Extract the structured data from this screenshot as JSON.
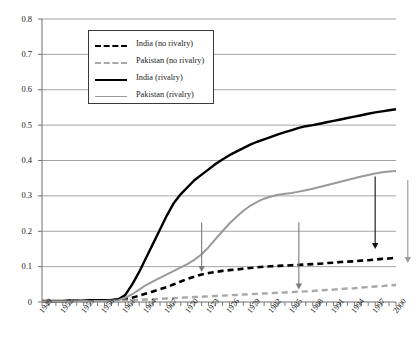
{
  "chart_data": {
    "type": "line",
    "title": "",
    "xlabel": "",
    "ylabel": "",
    "xlim": [
      1949,
      2000
    ],
    "ylim": [
      0,
      0.8
    ],
    "grid": true,
    "legend_position": "upper-left-inside",
    "ytick_labels": [
      "0",
      "0.1",
      "0.2",
      "0.3",
      "0.4",
      "0.5",
      "0.6",
      "0.7",
      "0.8"
    ],
    "ytick_values": [
      0,
      0.1,
      0.2,
      0.3,
      0.4,
      0.5,
      0.6,
      0.7,
      0.8
    ],
    "xtick_labels": [
      "1949",
      "1952",
      "1955",
      "1958",
      "1961",
      "1964",
      "1967",
      "1970",
      "1973",
      "1976",
      "1979",
      "1982",
      "1985",
      "1988",
      "1991",
      "1994",
      "1997",
      "2000"
    ],
    "xtick_values": [
      1949,
      1952,
      1955,
      1958,
      1961,
      1964,
      1967,
      1970,
      1973,
      1976,
      1979,
      1982,
      1985,
      1988,
      1991,
      1994,
      1997,
      2000
    ],
    "x": [
      1949,
      1950,
      1951,
      1952,
      1953,
      1954,
      1955,
      1956,
      1957,
      1958,
      1959,
      1960,
      1961,
      1962,
      1963,
      1964,
      1965,
      1966,
      1967,
      1968,
      1969,
      1970,
      1971,
      1972,
      1973,
      1974,
      1975,
      1976,
      1977,
      1978,
      1979,
      1980,
      1981,
      1982,
      1983,
      1984,
      1985,
      1986,
      1987,
      1988,
      1989,
      1990,
      1991,
      1992,
      1993,
      1994,
      1995,
      1996,
      1997,
      1998,
      1999,
      2000
    ],
    "series": [
      {
        "name": "India (no rivalry)",
        "color": "#000000",
        "style": "dashed",
        "width": 2.6,
        "values": [
          0.002,
          0.002,
          0.002,
          0.002,
          0.003,
          0.003,
          0.003,
          0.004,
          0.004,
          0.005,
          0.005,
          0.006,
          0.008,
          0.012,
          0.018,
          0.024,
          0.03,
          0.036,
          0.042,
          0.05,
          0.058,
          0.066,
          0.072,
          0.078,
          0.082,
          0.085,
          0.088,
          0.09,
          0.092,
          0.094,
          0.096,
          0.098,
          0.1,
          0.101,
          0.102,
          0.103,
          0.104,
          0.105,
          0.106,
          0.107,
          0.108,
          0.11,
          0.111,
          0.113,
          0.114,
          0.115,
          0.117,
          0.118,
          0.12,
          0.122,
          0.123,
          0.125
        ]
      },
      {
        "name": "Pakistan (no rivalry)",
        "color": "#a8a8a8",
        "style": "dashed",
        "width": 2.4,
        "values": [
          0.001,
          0.001,
          0.001,
          0.001,
          0.001,
          0.001,
          0.002,
          0.002,
          0.002,
          0.002,
          0.003,
          0.003,
          0.004,
          0.005,
          0.006,
          0.007,
          0.008,
          0.009,
          0.01,
          0.011,
          0.012,
          0.013,
          0.014,
          0.015,
          0.016,
          0.017,
          0.018,
          0.019,
          0.02,
          0.021,
          0.022,
          0.023,
          0.024,
          0.025,
          0.026,
          0.027,
          0.028,
          0.029,
          0.03,
          0.031,
          0.033,
          0.034,
          0.035,
          0.037,
          0.038,
          0.039,
          0.041,
          0.042,
          0.044,
          0.045,
          0.047,
          0.048
        ]
      },
      {
        "name": "India (rivalry)",
        "color": "#000000",
        "style": "solid",
        "width": 2.4,
        "values": [
          0.003,
          0.003,
          0.003,
          0.003,
          0.004,
          0.004,
          0.004,
          0.005,
          0.005,
          0.005,
          0.006,
          0.008,
          0.02,
          0.05,
          0.085,
          0.125,
          0.165,
          0.205,
          0.245,
          0.28,
          0.305,
          0.325,
          0.345,
          0.36,
          0.375,
          0.39,
          0.403,
          0.415,
          0.425,
          0.435,
          0.445,
          0.453,
          0.46,
          0.467,
          0.474,
          0.48,
          0.486,
          0.492,
          0.497,
          0.5,
          0.504,
          0.508,
          0.512,
          0.516,
          0.52,
          0.524,
          0.528,
          0.532,
          0.536,
          0.539,
          0.542,
          0.545
        ]
      },
      {
        "name": "Pakistan (rivalry)",
        "color": "#9a9a9a",
        "style": "solid",
        "width": 2.0,
        "values": [
          0.002,
          0.002,
          0.002,
          0.002,
          0.002,
          0.002,
          0.003,
          0.003,
          0.003,
          0.003,
          0.004,
          0.005,
          0.012,
          0.022,
          0.035,
          0.048,
          0.058,
          0.068,
          0.078,
          0.088,
          0.098,
          0.108,
          0.12,
          0.135,
          0.155,
          0.178,
          0.2,
          0.222,
          0.24,
          0.258,
          0.272,
          0.283,
          0.292,
          0.298,
          0.303,
          0.306,
          0.308,
          0.312,
          0.316,
          0.32,
          0.325,
          0.33,
          0.335,
          0.34,
          0.345,
          0.35,
          0.355,
          0.359,
          0.363,
          0.367,
          0.369,
          0.37
        ]
      }
    ],
    "annotations": [
      {
        "name": "arrow-1972-gray",
        "type": "arrow",
        "color": "#7a7a7a",
        "x": 1972,
        "y_from": 0.225,
        "y_to": 0.085
      },
      {
        "name": "arrow-1986-gray",
        "type": "arrow",
        "color": "#7a7a7a",
        "x": 1986,
        "y_from": 0.225,
        "y_to": 0.035
      },
      {
        "name": "arrow-1997-black",
        "type": "arrow",
        "color": "#111111",
        "x": 1997,
        "y_from": 0.355,
        "y_to": 0.15
      },
      {
        "name": "arrow-right-edge-gray",
        "type": "arrow",
        "color": "#9a9a9a",
        "x": 2001.7,
        "y_from": 0.345,
        "y_to": 0.11
      }
    ]
  },
  "legend": {
    "items": [
      {
        "label": "India (no rivalry)",
        "swatch": "dash-black"
      },
      {
        "label": "Pakistan (no rivalry)",
        "swatch": "dash-gray"
      },
      {
        "label": "India (rivalry)",
        "swatch": "solid-black"
      },
      {
        "label": "Pakistan (rivalry)",
        "swatch": "solid-gray"
      }
    ]
  },
  "axes": {
    "y_axis_name": "y-axis",
    "x_axis_name": "x-axis"
  }
}
